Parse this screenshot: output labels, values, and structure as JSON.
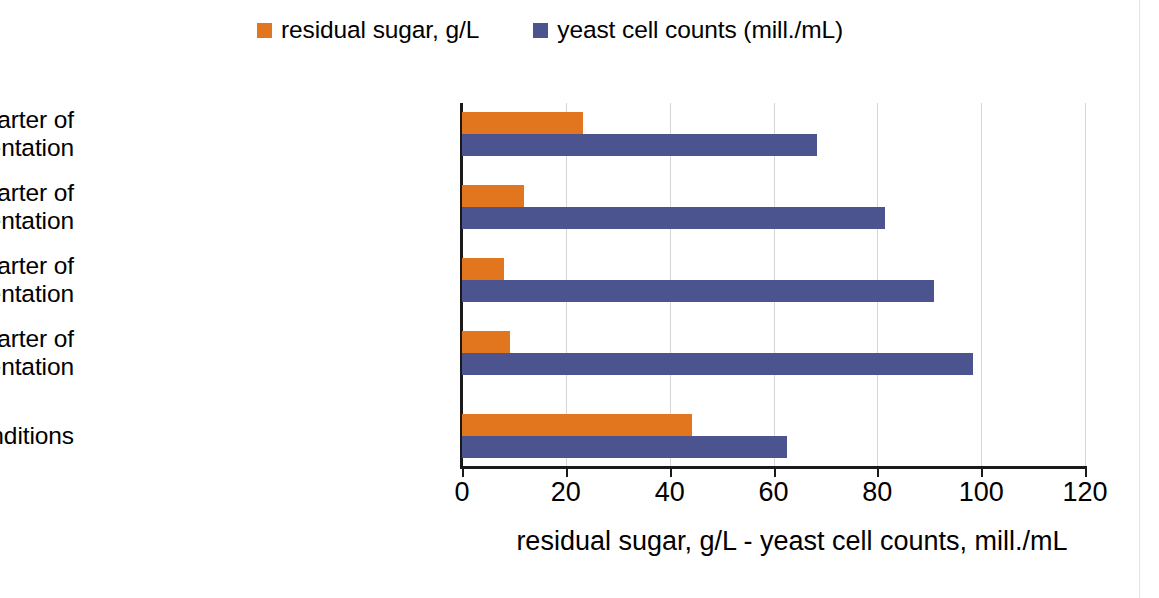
{
  "chart_data": {
    "type": "bar",
    "orientation": "horizontal",
    "title": "",
    "xlabel": "residual sugar, g/L  -  yeast cell counts, mill./mL",
    "ylabel": "",
    "xlim": [
      0,
      120
    ],
    "xticks": [
      0,
      20,
      40,
      60,
      80,
      100,
      120
    ],
    "xtick_labels": [
      "0",
      "20",
      "40",
      "60",
      "80",
      "100",
      "120"
    ],
    "grid": true,
    "grid_axis": "x",
    "legend_position": "top-center",
    "categories": [
      "oxygenation in the 4th quarter of fermentation",
      "oxygenation in the 3rd quarter of fermentation",
      "oxygenation in the 2nd quarter of fermentation",
      "oxygenation in the 1st quarter of fermentation",
      "inert conditions"
    ],
    "category_lines": [
      [
        "oxygenation in the 4th quarter of",
        "fermentation"
      ],
      [
        "oxygenation in the 3rd quarter of",
        "fermentation"
      ],
      [
        "oxygenation in the 2nd quarter of",
        "fermentation"
      ],
      [
        "oxygenation in the 1st quarter of",
        "fermentation"
      ],
      [
        "inert conditions"
      ]
    ],
    "series": [
      {
        "name": "residual sugar, g/L",
        "color": "#E2761F",
        "values": [
          23.4,
          12.0,
          8.1,
          9.3,
          44.3
        ]
      },
      {
        "name": "yeast cell counts (mill./mL)",
        "color": "#4C5490",
        "values": [
          68.3,
          81.5,
          91.0,
          98.4,
          62.6
        ]
      }
    ]
  },
  "legend": {
    "items": [
      {
        "label": "residual sugar, g/L",
        "color": "#E2761F"
      },
      {
        "label": "yeast cell counts (mill./mL)",
        "color": "#4C5490"
      }
    ]
  },
  "axis": {
    "x_title": "residual sugar, g/L  -  yeast cell counts, mill./mL"
  }
}
